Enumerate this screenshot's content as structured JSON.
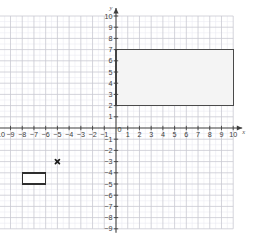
{
  "figure": {
    "kind": "coordinate-plane",
    "background_color": "#ffffff",
    "axis_color": "#3f3f3f",
    "major_grid_color": "#c9c9d2",
    "minor_grid_color": "#ebebf1",
    "label_color": "#3b3b3b"
  },
  "axes": {
    "x_axis_name": "x",
    "y_axis_name": "y",
    "origin_label": "0",
    "x_min": -10,
    "x_max": 10,
    "y_min": -9,
    "y_max": 10,
    "x_tick_labels": [
      "-10",
      "-9",
      "-8",
      "-7",
      "-6",
      "-5",
      "-4",
      "-3",
      "-2",
      "-1",
      "1",
      "2",
      "3",
      "4",
      "5",
      "6",
      "7",
      "8",
      "9",
      "10"
    ],
    "y_tick_labels": [
      "10",
      "9",
      "8",
      "7",
      "6",
      "5",
      "4",
      "3",
      "2",
      "1",
      "-1",
      "-2",
      "-3",
      "-4",
      "-5",
      "-6",
      "-7",
      "-8",
      "-9"
    ]
  },
  "chart_data": {
    "type": "scatter",
    "title": "",
    "xlabel": "x",
    "ylabel": "y",
    "xlim": [
      -10,
      10
    ],
    "ylim": [
      -9,
      10
    ],
    "grid": true,
    "legend": "none",
    "shapes": [
      {
        "name": "large-rectangle",
        "type": "rectangle",
        "x_left": 0,
        "x_right": 10,
        "y_bottom": 2,
        "y_top": 7,
        "width_units": 10,
        "height_units": 5,
        "fill": "#f4f4f4",
        "stroke": "#4a4a4a",
        "stroke_width": 1.4,
        "vertices": [
          [
            0,
            2
          ],
          [
            10,
            2
          ],
          [
            10,
            7
          ],
          [
            0,
            7
          ]
        ]
      },
      {
        "name": "small-rectangle",
        "type": "rectangle",
        "x_left": -8,
        "x_right": -6,
        "y_bottom": -5,
        "y_top": -4,
        "width_units": 2,
        "height_units": 1,
        "fill": "#ffffff",
        "stroke": "#2e2e2e",
        "stroke_width": 1.4,
        "vertices": [
          [
            -8,
            -5
          ],
          [
            -6,
            -5
          ],
          [
            -6,
            -4
          ],
          [
            -8,
            -4
          ]
        ]
      }
    ],
    "points": [
      {
        "name": "cross-marker",
        "x": -5,
        "y": -3,
        "marker": "x",
        "color": "#1a1a1a",
        "size": 4
      }
    ]
  }
}
